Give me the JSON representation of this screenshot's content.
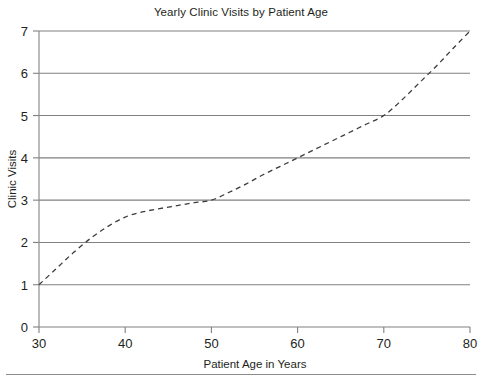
{
  "chart_data": {
    "type": "line",
    "title": "Yearly Clinic Visits by Patient Age",
    "xlabel": "Patient Age in Years",
    "ylabel": "Clinic Visits",
    "xlim": [
      30,
      80
    ],
    "ylim": [
      0,
      7
    ],
    "xticks": [
      30,
      40,
      50,
      60,
      70,
      80
    ],
    "yticks": [
      0,
      1,
      2,
      3,
      4,
      5,
      6,
      7
    ],
    "grid": "horizontal",
    "legend": "none",
    "line_style": "dashed",
    "line_color": "#3b3b3b",
    "grid_color": "#808080",
    "series": [
      {
        "name": "Clinic Visits",
        "x": [
          30,
          32,
          34,
          36,
          38,
          40,
          42,
          44,
          46,
          48,
          50,
          52,
          54,
          56,
          58,
          60,
          62,
          64,
          66,
          68,
          70,
          72,
          74,
          76,
          78,
          80
        ],
        "values": [
          1.0,
          1.38,
          1.76,
          2.1,
          2.38,
          2.6,
          2.72,
          2.8,
          2.87,
          2.94,
          3.0,
          3.18,
          3.38,
          3.6,
          3.8,
          4.0,
          4.2,
          4.4,
          4.6,
          4.8,
          5.0,
          5.35,
          5.75,
          6.15,
          6.58,
          7.0
        ]
      }
    ]
  },
  "axis_labels": {
    "x": [
      "30",
      "40",
      "50",
      "60",
      "70",
      "80"
    ],
    "y": [
      "0",
      "1",
      "2",
      "3",
      "4",
      "5",
      "6",
      "7"
    ]
  },
  "figure": {
    "title": "Yearly Clinic Visits by Patient Age",
    "x_axis_title": "Patient Age in Years",
    "y_axis_title": "Clinic Visits"
  }
}
